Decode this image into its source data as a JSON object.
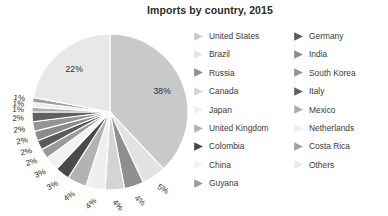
{
  "title": "Imports by country, 2015",
  "chart_data": {
    "type": "pie",
    "title": "Imports by country, 2015",
    "xlabel": "",
    "ylabel": "",
    "unit": "%",
    "legend_position": "right",
    "grid": false,
    "start_angle_deg": 0,
    "direction": "clockwise",
    "categories": [
      "United States",
      "Brazil",
      "Russia",
      "Canada",
      "Japan",
      "United Kingdom",
      "Colombia",
      "China",
      "Guyana",
      "Germany",
      "India",
      "South Korea",
      "Italy",
      "Mexico",
      "Netherlands",
      "Costa Rica",
      "Others"
    ],
    "values": [
      38,
      5,
      4,
      4,
      4,
      4,
      3,
      3,
      2,
      2,
      2,
      2,
      2,
      1,
      1,
      1,
      22
    ],
    "labels": [
      "38%",
      "5%",
      "4%",
      "4%",
      "4%",
      "4%",
      "3%",
      "3%",
      "2%",
      "2%",
      "2%",
      "2%",
      "2%",
      "1%",
      "1%",
      "1%",
      "22%"
    ],
    "colors": [
      "#c9c9c9",
      "#e2e2e2",
      "#8f8f8f",
      "#d4d4d4",
      "#efefef",
      "#b3b3b3",
      "#4a4a4a",
      "#f2f2f2",
      "#9a9a9a",
      "#5a5a5a",
      "#8b8b8b",
      "#949494",
      "#606060",
      "#adadad",
      "#ededed",
      "#a0a0a0",
      "#e8e8e8"
    ],
    "slice_separator_color": "#ffffff"
  },
  "legend": {
    "left_column": [
      {
        "label": "United States",
        "color": "#c9c9c9",
        "value": "38%"
      },
      {
        "label": "Brazil",
        "color": "#e2e2e2",
        "value": "5%"
      },
      {
        "label": "Russia",
        "color": "#8f8f8f",
        "value": "4%"
      },
      {
        "label": "Canada",
        "color": "#d4d4d4",
        "value": "4%"
      },
      {
        "label": "Japan",
        "color": "#efefef",
        "value": "4%"
      },
      {
        "label": "United Kingdom",
        "color": "#b3b3b3",
        "value": "4%"
      },
      {
        "label": "Colombia",
        "color": "#4a4a4a",
        "value": "3%"
      },
      {
        "label": "China",
        "color": "#f2f2f2",
        "value": "3%"
      },
      {
        "label": "Guyana",
        "color": "#9a9a9a",
        "value": "2%"
      }
    ],
    "right_column": [
      {
        "label": "Germany",
        "color": "#5a5a5a",
        "value": "2%"
      },
      {
        "label": "India",
        "color": "#8b8b8b",
        "value": "2%"
      },
      {
        "label": "South Korea",
        "color": "#949494",
        "value": "2%"
      },
      {
        "label": "Italy",
        "color": "#606060",
        "value": "2%"
      },
      {
        "label": "Mexico",
        "color": "#adadad",
        "value": "1%"
      },
      {
        "label": "Netherlands",
        "color": "#ededed",
        "value": "1%"
      },
      {
        "label": "Costa Rica",
        "color": "#a0a0a0",
        "value": "1%"
      },
      {
        "label": "Others",
        "color": "#e8e8e8",
        "value": "22%"
      }
    ]
  },
  "pie_geometry": {
    "cx": 110,
    "cy": 94,
    "r": 78,
    "label_radius_factor": 0.72,
    "outside_label_radius": 92
  }
}
